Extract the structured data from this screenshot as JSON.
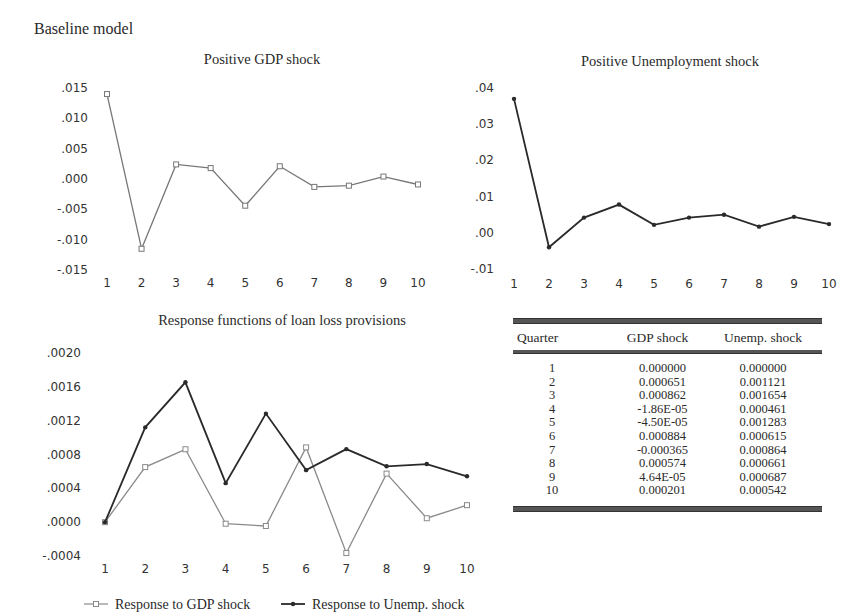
{
  "page": {
    "title": "Baseline model"
  },
  "chart_data": [
    {
      "type": "line",
      "title": "Positive GDP shock",
      "xlabel": "",
      "ylabel": "",
      "x": [
        1,
        2,
        3,
        4,
        5,
        6,
        7,
        8,
        9,
        10
      ],
      "ylim": [
        -0.015,
        0.015
      ],
      "yticks": [
        ".015",
        ".010",
        ".005",
        ".000",
        "-.005",
        "-.010",
        "-.015"
      ],
      "ytick_values": [
        0.015,
        0.01,
        0.005,
        0.0,
        -0.005,
        -0.01,
        -0.015
      ],
      "xticks": [
        "1",
        "2",
        "3",
        "4",
        "5",
        "6",
        "7",
        "8",
        "9",
        "10"
      ],
      "series": [
        {
          "name": "Positive GDP shock",
          "color": "#777777",
          "marker": "hollow-square",
          "values": [
            0.014,
            -0.0115,
            0.0024,
            0.0018,
            -0.0044,
            0.0021,
            -0.0013,
            -0.0011,
            0.0004,
            -0.0009
          ]
        }
      ],
      "grid": false,
      "legend": "none"
    },
    {
      "type": "line",
      "title": "Positive Unemployment shock",
      "xlabel": "",
      "ylabel": "",
      "x": [
        1,
        2,
        3,
        4,
        5,
        6,
        7,
        8,
        9,
        10
      ],
      "ylim": [
        -0.01,
        0.04
      ],
      "yticks": [
        ".04",
        ".03",
        ".02",
        ".01",
        ".00",
        "-.01"
      ],
      "ytick_values": [
        0.04,
        0.03,
        0.02,
        0.01,
        0.0,
        -0.01
      ],
      "xticks": [
        "1",
        "2",
        "3",
        "4",
        "5",
        "6",
        "7",
        "8",
        "9",
        "10"
      ],
      "series": [
        {
          "name": "Positive Unemployment shock",
          "color": "#2a2a2a",
          "marker": "filled-dot",
          "values": [
            0.037,
            -0.004,
            0.0042,
            0.0078,
            0.0022,
            0.0042,
            0.005,
            0.0017,
            0.0044,
            0.0024
          ]
        }
      ],
      "grid": false,
      "legend": "none"
    },
    {
      "type": "line",
      "title": "Response functions of loan loss provisions",
      "xlabel": "",
      "ylabel": "",
      "x": [
        1,
        2,
        3,
        4,
        5,
        6,
        7,
        8,
        9,
        10
      ],
      "ylim": [
        -0.0004,
        0.002
      ],
      "yticks": [
        ".0020",
        ".0016",
        ".0012",
        ".0008",
        ".0004",
        ".0000",
        "-.0004"
      ],
      "ytick_values": [
        0.002,
        0.0016,
        0.0012,
        0.0008,
        0.0004,
        0.0,
        -0.0004
      ],
      "xticks": [
        "1",
        "2",
        "3",
        "4",
        "5",
        "6",
        "7",
        "8",
        "9",
        "10"
      ],
      "series": [
        {
          "name": "Response to GDP shock",
          "color": "#8a8a8a",
          "marker": "hollow-square",
          "values": [
            0.0,
            0.000651,
            0.000862,
            -1.86e-05,
            -4.5e-05,
            0.000884,
            -0.000365,
            0.000574,
            4.64e-05,
            0.000201
          ]
        },
        {
          "name": "Response to Unemp. shock",
          "color": "#2a2a2a",
          "marker": "filled-dot",
          "values": [
            0.0,
            0.001121,
            0.001654,
            0.000461,
            0.001283,
            0.000615,
            0.000864,
            0.000661,
            0.000687,
            0.000542
          ]
        }
      ],
      "grid": false,
      "legend": "bottom"
    },
    {
      "type": "table",
      "columns": [
        "Quarter",
        "GDP shock",
        "Unemp. shock"
      ],
      "rows": [
        [
          "1",
          "0.000000",
          "0.000000"
        ],
        [
          "2",
          "0.000651",
          "0.001121"
        ],
        [
          "3",
          "0.000862",
          "0.001654"
        ],
        [
          "4",
          "-1.86E-05",
          "0.000461"
        ],
        [
          "5",
          "-4.50E-05",
          "0.001283"
        ],
        [
          "6",
          "0.000884",
          "0.000615"
        ],
        [
          "7",
          "-0.000365",
          "0.000864"
        ],
        [
          "8",
          "0.000574",
          "0.000661"
        ],
        [
          "9",
          "4.64E-05",
          "0.000687"
        ],
        [
          "10",
          "0.000201",
          "0.000542"
        ]
      ]
    }
  ]
}
